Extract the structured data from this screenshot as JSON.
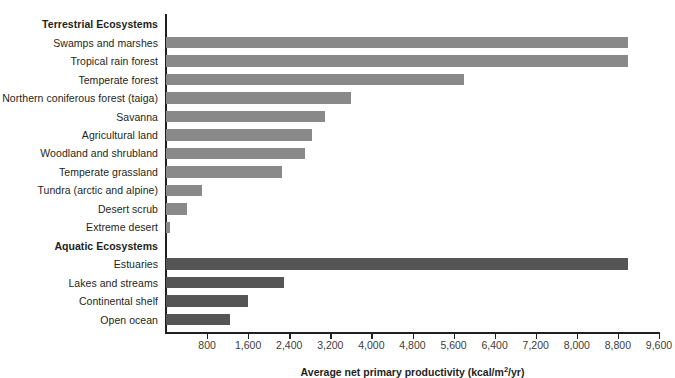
{
  "chart_data": {
    "type": "bar",
    "orientation": "horizontal",
    "title": "",
    "xlabel": "Average net primary productivity (kcal/m2/yr)",
    "xlabel_parts": {
      "pre": "Average net primary productivity (kcal/m",
      "sup": "2",
      "post": "/yr)"
    },
    "ylabel": "",
    "xlim": [
      0,
      9600
    ],
    "xticks": [
      800,
      1600,
      2400,
      3200,
      4000,
      4800,
      5600,
      6400,
      7200,
      8000,
      8800,
      9600
    ],
    "xtick_labels": [
      "800",
      "1,600",
      "2,400",
      "3,200",
      "4,000",
      "4,800",
      "5,600",
      "6,400",
      "7,200",
      "8,000",
      "8,800",
      "9,600"
    ],
    "grid": false,
    "legend": "none",
    "group_headers": [
      "Terrestrial Ecosystems",
      "Aquatic Ecosystems"
    ],
    "colors": {
      "terrestrial": "#898989",
      "aquatic": "#555555",
      "axis": "#231f20",
      "background": "#ffffff"
    },
    "rows": [
      {
        "kind": "group",
        "label": "Terrestrial Ecosystems"
      },
      {
        "kind": "bar",
        "label": "Swamps and marshes",
        "value": 9000,
        "group": "terrestrial"
      },
      {
        "kind": "bar",
        "label": "Tropical rain forest",
        "value": 9000,
        "group": "terrestrial"
      },
      {
        "kind": "bar",
        "label": "Temperate forest",
        "value": 5800,
        "group": "terrestrial"
      },
      {
        "kind": "bar",
        "label": "Northern coniferous forest (taiga)",
        "value": 3600,
        "group": "terrestrial"
      },
      {
        "kind": "bar",
        "label": "Savanna",
        "value": 3100,
        "group": "terrestrial"
      },
      {
        "kind": "bar",
        "label": "Agricultural land",
        "value": 2850,
        "group": "terrestrial"
      },
      {
        "kind": "bar",
        "label": "Woodland and shrubland",
        "value": 2700,
        "group": "terrestrial"
      },
      {
        "kind": "bar",
        "label": "Temperate grassland",
        "value": 2250,
        "group": "terrestrial"
      },
      {
        "kind": "bar",
        "label": "Tundra (arctic and alpine)",
        "value": 700,
        "group": "terrestrial"
      },
      {
        "kind": "bar",
        "label": "Desert scrub",
        "value": 400,
        "group": "terrestrial"
      },
      {
        "kind": "bar",
        "label": "Extreme desert",
        "value": 70,
        "group": "terrestrial"
      },
      {
        "kind": "group",
        "label": "Aquatic Ecosystems"
      },
      {
        "kind": "bar",
        "label": "Estuaries",
        "value": 9000,
        "group": "aquatic"
      },
      {
        "kind": "bar",
        "label": "Lakes and streams",
        "value": 2300,
        "group": "aquatic"
      },
      {
        "kind": "bar",
        "label": "Continental shelf",
        "value": 1600,
        "group": "aquatic"
      },
      {
        "kind": "bar",
        "label": "Open ocean",
        "value": 1250,
        "group": "aquatic"
      }
    ]
  }
}
